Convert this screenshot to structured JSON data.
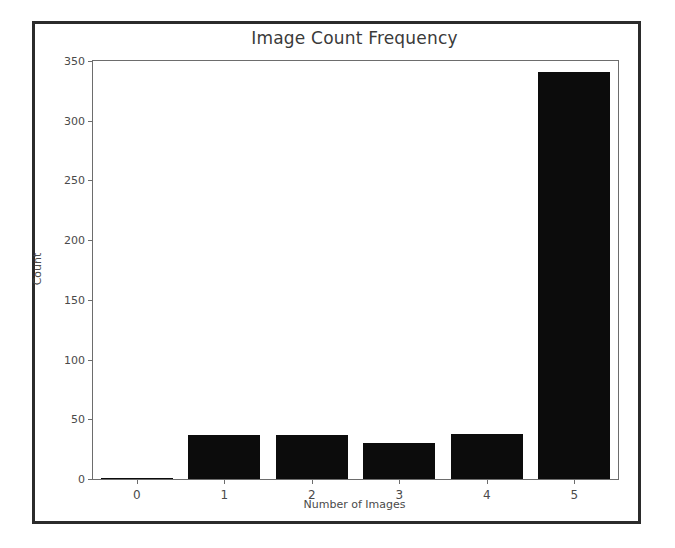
{
  "figure": {
    "background_color": "#ffffff",
    "frame_color": "#2b2b2b",
    "axes_color": "#6d6d6d",
    "bar_color": "#0c0c0c"
  },
  "chart_data": {
    "type": "bar",
    "title": "Image Count Frequency",
    "xlabel": "Number of Images",
    "ylabel": "Count",
    "categories": [
      "0",
      "1",
      "2",
      "3",
      "4",
      "5"
    ],
    "values": [
      1,
      37,
      37,
      30,
      38,
      341
    ],
    "ylim": [
      0,
      350
    ],
    "yticks": [
      "0",
      "50",
      "100",
      "150",
      "200",
      "250",
      "300",
      "350"
    ],
    "ytick_values": [
      0,
      50,
      100,
      150,
      200,
      250,
      300,
      350
    ],
    "xticks": [
      "0",
      "1",
      "2",
      "3",
      "4",
      "5"
    ],
    "grid": false,
    "legend": false,
    "series": [
      {
        "name": "Count",
        "values": [
          1,
          37,
          37,
          30,
          38,
          341
        ]
      }
    ]
  }
}
